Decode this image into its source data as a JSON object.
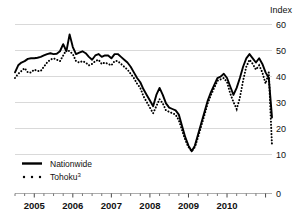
{
  "chart_data": {
    "type": "line",
    "title": "",
    "subtitle": "",
    "xlabel": "",
    "ylabel": "Index",
    "ylim": [
      0,
      60
    ],
    "yticks": [
      0,
      10,
      20,
      30,
      40,
      50,
      60
    ],
    "ytick_labels": [
      "0",
      "10",
      "20",
      "30",
      "40",
      "50",
      "60"
    ],
    "grid": true,
    "grid_axis": "y",
    "legend_position": "lower-left",
    "xlim": [
      "2004-07",
      "2011-04"
    ],
    "xtick_labels": [
      "2005",
      "2006",
      "2007",
      "2008",
      "2009",
      "2010"
    ],
    "xtick_positions": [
      2005.0,
      2006.0,
      2007.0,
      2008.0,
      2009.0,
      2010.0
    ],
    "minor_tick_interval_months": 3,
    "x": [
      "2004-07",
      "2004-08",
      "2004-09",
      "2004-10",
      "2004-11",
      "2004-12",
      "2005-01",
      "2005-02",
      "2005-03",
      "2005-04",
      "2005-05",
      "2005-06",
      "2005-07",
      "2005-08",
      "2005-09",
      "2005-10",
      "2005-11",
      "2005-12",
      "2006-01",
      "2006-02",
      "2006-03",
      "2006-04",
      "2006-05",
      "2006-06",
      "2006-07",
      "2006-08",
      "2006-09",
      "2006-10",
      "2006-11",
      "2006-12",
      "2007-01",
      "2007-02",
      "2007-03",
      "2007-04",
      "2007-05",
      "2007-06",
      "2007-07",
      "2007-08",
      "2007-09",
      "2007-10",
      "2007-11",
      "2007-12",
      "2008-01",
      "2008-02",
      "2008-03",
      "2008-04",
      "2008-05",
      "2008-06",
      "2008-07",
      "2008-08",
      "2008-09",
      "2008-10",
      "2008-11",
      "2008-12",
      "2009-01",
      "2009-02",
      "2009-03",
      "2009-04",
      "2009-05",
      "2009-06",
      "2009-07",
      "2009-08",
      "2009-09",
      "2009-10",
      "2009-11",
      "2009-12",
      "2010-01",
      "2010-02",
      "2010-03",
      "2010-04",
      "2010-05",
      "2010-06",
      "2010-07",
      "2010-08",
      "2010-09",
      "2010-10",
      "2010-11",
      "2010-12",
      "2011-01",
      "2011-02",
      "2011-03"
    ],
    "series": [
      {
        "name": "Nationwide",
        "style": "solid",
        "values": [
          43.0,
          45.5,
          46.5,
          47.0,
          47.8,
          48.0,
          48.0,
          48.2,
          48.5,
          49.0,
          49.5,
          49.8,
          49.5,
          49.6,
          50.5,
          53.0,
          50.5,
          56.5,
          52.0,
          49.5,
          50.0,
          50.5,
          49.8,
          48.5,
          47.5,
          49.0,
          49.5,
          48.5,
          49.0,
          49.0,
          48.0,
          49.5,
          49.5,
          48.5,
          47.5,
          46.5,
          45.0,
          43.0,
          41.0,
          39.5,
          37.0,
          35.0,
          33.0,
          31.0,
          35.0,
          37.5,
          35.0,
          32.0,
          30.5,
          30.0,
          29.5,
          28.0,
          24.0,
          20.0,
          17.0,
          15.0,
          17.0,
          21.0,
          25.0,
          29.0,
          33.0,
          36.0,
          38.5,
          41.0,
          41.5,
          42.5,
          41.0,
          38.0,
          35.0,
          37.5,
          41.0,
          45.0,
          48.0,
          49.5,
          48.0,
          46.5,
          48.0,
          46.0,
          43.0,
          41.0,
          27.0
        ]
      },
      {
        "name": "Tohoku",
        "footnote": "3",
        "style": "dotted",
        "values": [
          41.0,
          42.5,
          43.5,
          44.5,
          43.0,
          43.0,
          44.0,
          43.5,
          43.5,
          45.0,
          46.5,
          47.5,
          48.0,
          47.5,
          47.0,
          49.0,
          51.0,
          50.5,
          49.5,
          47.0,
          46.5,
          47.0,
          46.5,
          45.5,
          46.0,
          47.0,
          47.5,
          46.0,
          46.5,
          46.0,
          45.5,
          47.0,
          47.0,
          46.0,
          45.0,
          44.0,
          42.5,
          41.0,
          39.0,
          37.5,
          34.5,
          32.5,
          30.5,
          28.5,
          31.0,
          33.5,
          32.0,
          29.5,
          29.0,
          28.5,
          28.0,
          26.0,
          22.5,
          19.0,
          16.5,
          15.0,
          16.5,
          20.0,
          24.0,
          28.0,
          32.0,
          35.0,
          37.5,
          40.0,
          40.5,
          41.0,
          39.5,
          35.5,
          32.5,
          30.0,
          34.0,
          40.0,
          45.0,
          47.5,
          46.0,
          44.0,
          45.5,
          43.0,
          39.0,
          43.0,
          17.0
        ]
      }
    ],
    "colors": {
      "series_line": "#000000",
      "gridline": "#c8c8c8",
      "axis": "#8a8a8a",
      "background": "#ffffff"
    }
  },
  "legend": {
    "items": [
      {
        "label": "Nationwide",
        "footnote": "",
        "marker": "solid-line"
      },
      {
        "label": "Tohoku",
        "footnote": "3",
        "marker": "dotted-line"
      }
    ]
  },
  "axes": {
    "y_title": "Index",
    "y_labels": [
      "60",
      "50",
      "40",
      "30",
      "20",
      "10",
      "0"
    ],
    "x_labels": [
      "2005",
      "2006",
      "2007",
      "2008",
      "2009",
      "2010"
    ]
  }
}
